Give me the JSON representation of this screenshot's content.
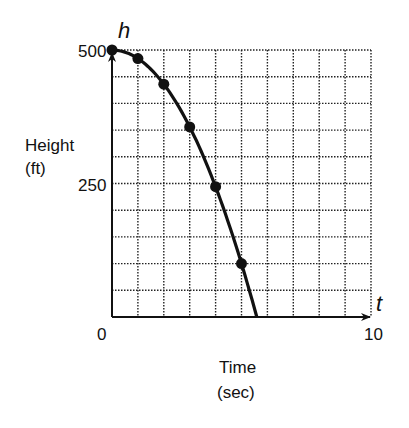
{
  "chart_data": {
    "type": "scatter",
    "title": "",
    "xlabel": "Time (sec)",
    "xlabel_lines": [
      "Time",
      "(sec)"
    ],
    "ylabel": "Height (ft)",
    "ylabel_lines": [
      "Height",
      "(ft)"
    ],
    "x_axis_var": "t",
    "y_axis_var": "h",
    "xlim": [
      0,
      10
    ],
    "ylim": [
      0,
      500
    ],
    "x_tick_labels": [
      "0",
      "10"
    ],
    "y_tick_labels": [
      "500",
      "250"
    ],
    "origin_label": "0",
    "grid": true,
    "grid_style": "dotted",
    "grid_divisions": {
      "x": 10,
      "y": 10
    },
    "legend": null,
    "series": [
      {
        "name": "Height",
        "markers": true,
        "points": [
          {
            "t": 0,
            "h": 500
          },
          {
            "t": 1,
            "h": 484
          },
          {
            "t": 2,
            "h": 436
          },
          {
            "t": 3,
            "h": 356
          },
          {
            "t": 4,
            "h": 244
          },
          {
            "t": 5,
            "h": 100
          }
        ],
        "curve_end": {
          "t": 5.59,
          "h": 0
        }
      }
    ]
  }
}
